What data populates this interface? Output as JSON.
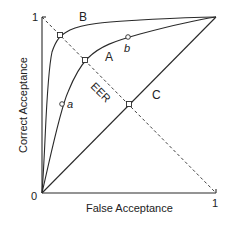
{
  "diagram": {
    "x_axis": {
      "label": "False Acceptance",
      "tick_min": "0",
      "tick_max": "1"
    },
    "y_axis": {
      "label": "Correct Acceptance",
      "tick_max": "1"
    },
    "curves": [
      {
        "id": "A",
        "label": "A"
      },
      {
        "id": "B",
        "label": "B"
      },
      {
        "id": "C",
        "label": "C"
      }
    ],
    "eer_line": {
      "label": "EER"
    },
    "points": [
      {
        "id": "a",
        "label": "a"
      },
      {
        "id": "b",
        "label": "b"
      }
    ],
    "colors": {
      "line": "#2a2a2a",
      "text": "#222222",
      "background": "#ffffff"
    }
  }
}
